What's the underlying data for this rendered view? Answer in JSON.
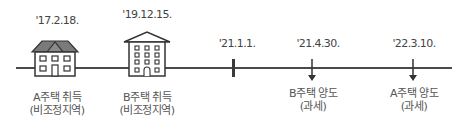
{
  "diagram": {
    "type": "timeline",
    "events": [
      {
        "date": "'17.2.18.",
        "label_line1": "A주택 취득",
        "label_line2": "(비조정지역)",
        "marker": "house-icon"
      },
      {
        "date": "'19.12.15.",
        "label_line1": "B주택 취득",
        "label_line2": "(비조정지역)",
        "marker": "apartment-building-icon"
      },
      {
        "date": "'21.1.1.",
        "label_line1": "",
        "label_line2": "",
        "marker": "tick-mark"
      },
      {
        "date": "'21.4.30.",
        "label_line1": "B주택 양도",
        "label_line2": "(과세)",
        "marker": "down-arrow-icon"
      },
      {
        "date": "'22.3.10.",
        "label_line1": "A주택 양도",
        "label_line2": "(과세)",
        "marker": "down-arrow-icon"
      }
    ],
    "colors": {
      "line": "#4a4a4a",
      "roof": "#7a7a7a",
      "text": "#444444"
    }
  }
}
